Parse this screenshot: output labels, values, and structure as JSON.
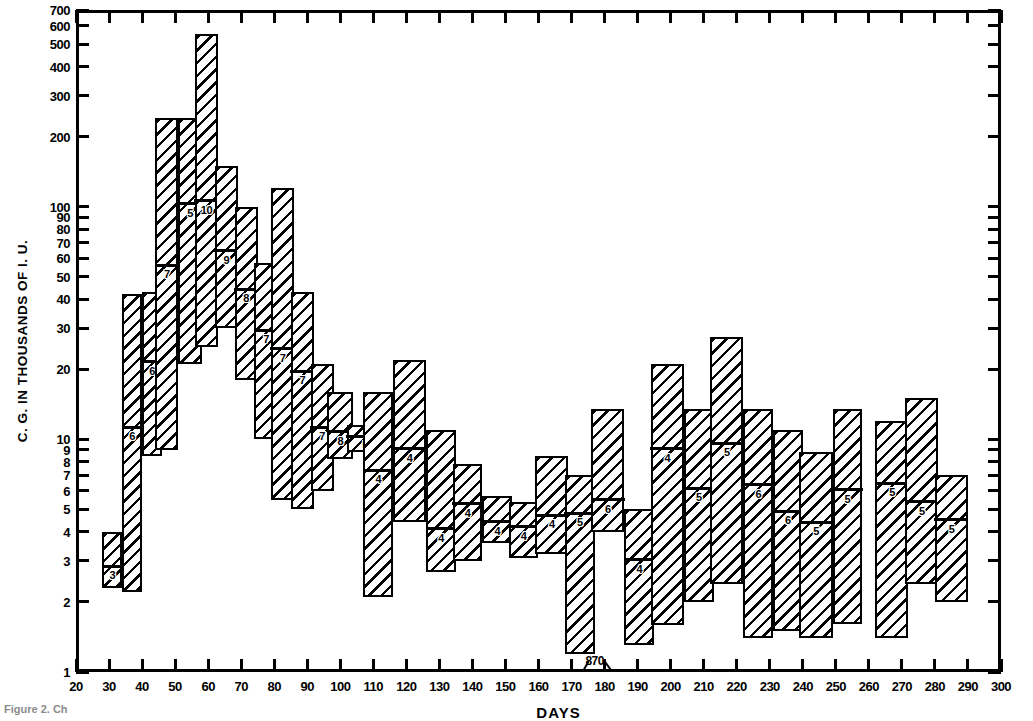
{
  "figure": {
    "caption_fragment": "Figure 2. Ch",
    "annotation": {
      "label": "870",
      "x": 177,
      "y": 1.18
    }
  },
  "chart_data": {
    "type": "bar",
    "subtype": "range-bars-with-median",
    "title": "",
    "xlabel": "DAYS",
    "ylabel": "C. G. IN THOUSANDS OF I. U.",
    "yscale": "log",
    "ylim": [
      1,
      700
    ],
    "xlim": [
      20,
      300
    ],
    "grid": false,
    "legend": null,
    "ytick_labels": [
      "1",
      "2",
      "3",
      "4",
      "5",
      "6",
      "7",
      "8",
      "9",
      "10",
      "20",
      "30",
      "40",
      "50",
      "60",
      "70",
      "80",
      "90",
      "100",
      "200",
      "300",
      "400",
      "500",
      "600",
      "700"
    ],
    "ytick_major_labeled": [
      "1",
      "2",
      "3",
      "4",
      "5",
      "6",
      "7",
      "8",
      "9",
      "10",
      "20",
      "30",
      "40",
      "50",
      "60",
      "70",
      "80",
      "90",
      "100",
      "200",
      "300",
      "400",
      "500",
      "600",
      "700"
    ],
    "xtick_labels": [
      "20",
      "30",
      "40",
      "50",
      "60",
      "70",
      "80",
      "90",
      "100",
      "110",
      "120",
      "130",
      "140",
      "150",
      "160",
      "170",
      "180",
      "190",
      "200",
      "210",
      "220",
      "230",
      "240",
      "250",
      "260",
      "270",
      "280",
      "290",
      "300"
    ],
    "xtick_values": [
      20,
      30,
      40,
      50,
      60,
      70,
      80,
      90,
      100,
      110,
      120,
      130,
      140,
      150,
      160,
      170,
      180,
      190,
      200,
      210,
      220,
      230,
      240,
      250,
      260,
      270,
      280,
      290,
      300
    ],
    "bar_axis_note": "each bar spans one interval on the DAYS axis; box = observed range, horizontal rule = median, small digit = number of cases",
    "bars": [
      {
        "x0": 28,
        "x1": 34,
        "low": 2.3,
        "high": 4.0,
        "median": 2.9,
        "count": "3"
      },
      {
        "x0": 34,
        "x1": 40,
        "low": 2.2,
        "high": 42,
        "median": 11.5,
        "count": "6"
      },
      {
        "x0": 40,
        "x1": 46,
        "low": 8.5,
        "high": 43,
        "median": 22,
        "count": "6"
      },
      {
        "x0": 44,
        "x1": 51,
        "low": 9.0,
        "high": 240,
        "median": 57,
        "count": "7"
      },
      {
        "x0": 51,
        "x1": 58,
        "low": 21,
        "high": 240,
        "median": 105,
        "count": "5"
      },
      {
        "x0": 56,
        "x1": 63,
        "low": 25,
        "high": 550,
        "median": 108,
        "count": "10"
      },
      {
        "x0": 62,
        "x1": 69,
        "low": 30,
        "high": 150,
        "median": 66,
        "count": "9"
      },
      {
        "x0": 68,
        "x1": 75,
        "low": 18,
        "high": 100,
        "median": 45,
        "count": "8"
      },
      {
        "x0": 74,
        "x1": 81,
        "low": 10,
        "high": 57,
        "median": 30,
        "count": "7"
      },
      {
        "x0": 79,
        "x1": 86,
        "low": 5.5,
        "high": 120,
        "median": 25,
        "count": "7"
      },
      {
        "x0": 85,
        "x1": 92,
        "low": 5.0,
        "high": 43,
        "median": 20,
        "count": "7"
      },
      {
        "x0": 91,
        "x1": 98,
        "low": 6.0,
        "high": 21,
        "median": 11.5,
        "count": "7"
      },
      {
        "x0": 96,
        "x1": 104,
        "low": 8.2,
        "high": 16,
        "median": 11,
        "count": "8"
      },
      {
        "x0": 102,
        "x1": 113,
        "low": 8.8,
        "high": 11.5,
        "median": 10.5,
        "count": "5"
      },
      {
        "x0": 107,
        "x1": 116,
        "low": 2.1,
        "high": 16,
        "median": 7.5,
        "count": "4"
      },
      {
        "x0": 116,
        "x1": 126,
        "low": 4.4,
        "high": 22,
        "median": 9.3,
        "count": "4"
      },
      {
        "x0": 126,
        "x1": 135,
        "low": 2.7,
        "high": 11,
        "median": 4.2,
        "count": "4"
      },
      {
        "x0": 134,
        "x1": 143,
        "low": 3.0,
        "high": 7.8,
        "median": 5.4,
        "count": "4"
      },
      {
        "x0": 143,
        "x1": 152,
        "low": 3.6,
        "high": 5.7,
        "median": 4.5,
        "count": "4"
      },
      {
        "x0": 151,
        "x1": 160,
        "low": 3.1,
        "high": 5.4,
        "median": 4.3,
        "count": "4"
      },
      {
        "x0": 159,
        "x1": 169,
        "low": 3.2,
        "high": 8.5,
        "median": 4.8,
        "count": "4"
      },
      {
        "x0": 168,
        "x1": 177,
        "low": 1.2,
        "high": 7.0,
        "median": 4.9,
        "count": "5"
      },
      {
        "x0": 176,
        "x1": 186,
        "low": 4.0,
        "high": 13.5,
        "median": 5.6,
        "count": "6"
      },
      {
        "x0": 186,
        "x1": 195,
        "low": 1.3,
        "high": 5.0,
        "median": 3.1,
        "count": "4"
      },
      {
        "x0": 194,
        "x1": 204,
        "low": 1.6,
        "high": 21,
        "median": 9.3,
        "count": "4"
      },
      {
        "x0": 204,
        "x1": 213,
        "low": 2.0,
        "high": 13.5,
        "median": 6.3,
        "count": "5"
      },
      {
        "x0": 212,
        "x1": 222,
        "low": 2.4,
        "high": 27.5,
        "median": 9.8,
        "count": "5"
      },
      {
        "x0": 222,
        "x1": 231,
        "low": 1.4,
        "high": 13.5,
        "median": 6.5,
        "count": "6"
      },
      {
        "x0": 231,
        "x1": 240,
        "low": 1.5,
        "high": 11,
        "median": 5.0,
        "count": "6"
      },
      {
        "x0": 239,
        "x1": 249,
        "low": 1.4,
        "high": 8.8,
        "median": 4.5,
        "count": "5"
      },
      {
        "x0": 249,
        "x1": 258,
        "low": 1.6,
        "high": 13.5,
        "median": 6.2,
        "count": "5"
      },
      {
        "x0": 262,
        "x1": 272,
        "low": 1.4,
        "high": 12.0,
        "median": 6.6,
        "count": "5"
      },
      {
        "x0": 271,
        "x1": 281,
        "low": 2.4,
        "high": 15.0,
        "median": 5.5,
        "count": "5"
      },
      {
        "x0": 280,
        "x1": 290,
        "low": 2.0,
        "high": 7.0,
        "median": 4.6,
        "count": "5"
      }
    ]
  }
}
